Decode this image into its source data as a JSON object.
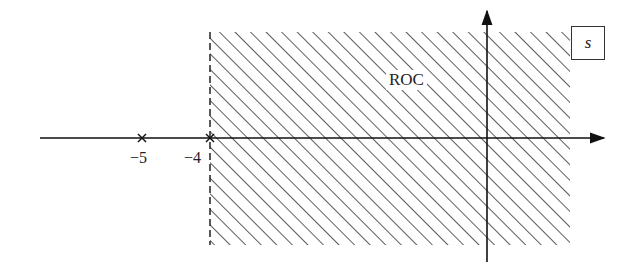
{
  "diagram": {
    "plane_label": "s",
    "roc_label": "ROC",
    "poles": [
      {
        "value": -5,
        "label": "−5",
        "marker": "x"
      },
      {
        "value": -4,
        "label": "−4",
        "marker": "x"
      }
    ],
    "roc": {
      "type": "right-half",
      "boundary": "Re(s) > -4",
      "boundary_style": "dashed",
      "fill": "diagonal-hatch"
    },
    "axes": {
      "horizontal": "real-axis-arrow",
      "vertical": "imaginary-axis-arrow"
    },
    "colors": {
      "line": "#222222",
      "hatch": "#333333",
      "background": "#ffffff"
    }
  }
}
